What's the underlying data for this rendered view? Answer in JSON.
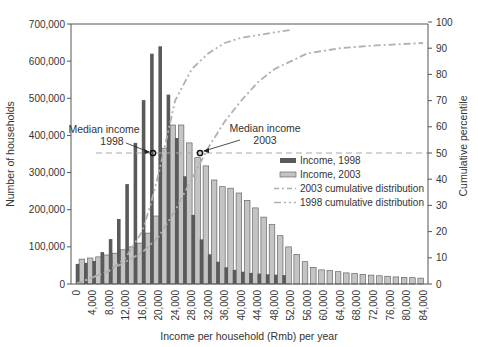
{
  "chart_data": {
    "type": "bar",
    "title": "",
    "xlabel": "Income per household (Rmb) per year",
    "ylabel": "Number of households",
    "y2label": "Cumulative percentile",
    "ylim": [
      0,
      700000
    ],
    "y2lim": [
      0,
      100
    ],
    "grid": false,
    "legend_position": "right-center inside plot",
    "x_tick_labels": [
      "0",
      "4,000",
      "8,000",
      "12,000",
      "16,000",
      "20,000",
      "24,000",
      "28,000",
      "32,000",
      "36,000",
      "40,000",
      "44,000",
      "48,000",
      "52,000",
      "56,000",
      "60,000",
      "64,000",
      "68,000",
      "72,000",
      "76,000",
      "80,000",
      "84,000"
    ],
    "y_tick_labels": [
      "0",
      "100,000",
      "200,000",
      "300,000",
      "400,000",
      "500,000",
      "600,000",
      "700,000"
    ],
    "y2_tick_labels": [
      "0",
      "10",
      "20",
      "30",
      "40",
      "50",
      "60",
      "70",
      "80",
      "90",
      "100"
    ],
    "categories": [
      2000,
      4000,
      6000,
      8000,
      10000,
      12000,
      14000,
      16000,
      18000,
      20000,
      22000,
      24000,
      26000,
      28000,
      30000,
      32000,
      34000,
      36000,
      38000,
      40000,
      42000,
      44000,
      46000,
      48000,
      50000,
      52000,
      54000,
      56000,
      58000,
      60000,
      62000,
      64000,
      66000,
      68000,
      70000,
      72000,
      74000,
      76000,
      78000,
      80000,
      82000,
      84000
    ],
    "series": [
      {
        "name": "Income, 1998",
        "kind": "bar",
        "color": "#5a5a5a",
        "values": [
          54000,
          57000,
          62000,
          86000,
          121000,
          175000,
          269000,
          380000,
          495000,
          620000,
          640000,
          510000,
          393000,
          290000,
          186000,
          120000,
          80000,
          60000,
          45000,
          38000,
          33000,
          30000,
          28000,
          26000,
          25000,
          24000,
          0,
          0,
          0,
          0,
          0,
          0,
          0,
          0,
          0,
          0,
          0,
          0,
          0,
          0,
          0,
          0
        ]
      },
      {
        "name": "Income, 2003",
        "kind": "bar",
        "color": "#c4c4c4",
        "values": [
          67000,
          70000,
          73000,
          78000,
          83000,
          92000,
          100000,
          110000,
          137000,
          183000,
          366000,
          428000,
          428000,
          380000,
          340000,
          318000,
          280000,
          262000,
          258000,
          245000,
          225000,
          205000,
          180000,
          160000,
          130000,
          100000,
          80000,
          60000,
          45000,
          38000,
          36000,
          33000,
          30000,
          28000,
          26000,
          24000,
          22000,
          21000,
          19000,
          18000,
          17000,
          16000
        ]
      },
      {
        "name": "2003 cumulative distribution",
        "kind": "line",
        "axis": "y2",
        "style": "dash-dot",
        "color": "#b0b0b0",
        "x": [
          0,
          8000,
          16000,
          20000,
          24000,
          28000,
          32000,
          36000,
          40000,
          44000,
          48000,
          56000,
          64000,
          72000,
          84000
        ],
        "values": [
          0,
          5,
          12,
          18,
          28,
          40,
          52,
          62,
          70,
          77,
          82,
          88,
          90,
          91,
          92
        ]
      },
      {
        "name": "1998 cumulative distribution",
        "kind": "line",
        "axis": "y2",
        "style": "dash-dot-dot",
        "color": "#b0b0b0",
        "x": [
          0,
          8000,
          12000,
          16000,
          18000,
          20000,
          22000,
          24000,
          28000,
          32000,
          36000,
          40000,
          44000,
          48000,
          52000
        ],
        "values": [
          0,
          5,
          10,
          20,
          30,
          42,
          56,
          70,
          82,
          88,
          92,
          94,
          95,
          96,
          97
        ]
      }
    ],
    "reference_lines": [
      {
        "name": "Median (50th percentile)",
        "axis": "y2",
        "value": 50,
        "style": "dashed",
        "color": "#aaaaaa"
      }
    ],
    "annotations": [
      {
        "text_line1": "Median income",
        "text_line2": "1998",
        "x": 19000,
        "y2": 50
      },
      {
        "text_line1": "Median income",
        "text_line2": "2003",
        "x": 30000,
        "y2": 50
      }
    ]
  },
  "legend": {
    "items": [
      {
        "label": "Income, 1998",
        "swatch": "dark-bar"
      },
      {
        "label": "Income, 2003",
        "swatch": "light-bar"
      },
      {
        "label": "2003 cumulative distribution",
        "swatch": "dash-dot-line"
      },
      {
        "label": "1998 cumulative distribution",
        "swatch": "dash-dot-dot-line"
      }
    ]
  },
  "colors": {
    "bar_1998": "#5a5a5a",
    "bar_2003": "#c4c4c4",
    "bar_2003_stroke": "#555555",
    "curve": "#b0b0b0",
    "axis": "#555555",
    "median_line": "#aaaaaa"
  }
}
